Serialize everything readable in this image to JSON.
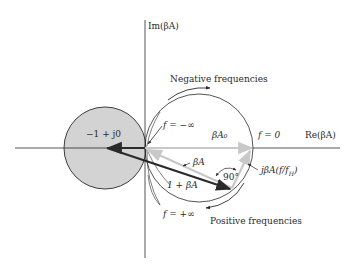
{
  "axes": {
    "imag_label": "Im(βA)",
    "real_label": "Re(βA)"
  },
  "labels": {
    "critical_point": "−1 + j0",
    "negative_frequencies": "Negative frequencies",
    "positive_frequencies": "Positive frequencies",
    "f_minus_inf": "f = −∞",
    "f_plus_inf": "f = +∞",
    "f_zero": "f = 0",
    "beta_a0": "βA₀",
    "beta_a": "βA",
    "one_plus_beta_a": "1 + βA",
    "right_angle": "90°",
    "j_term": "jβA(f/f",
    "j_term_sub": "H",
    "j_term_close": ")"
  },
  "colors": {
    "stroke": "#2a2a2a",
    "shaded_circle_fill": "#d3d3d3",
    "gray_vector": "#c8c8c8",
    "background": "#ffffff"
  },
  "geometry": {
    "origin": [
      145,
      148
    ],
    "critical_point": [
      105,
      148
    ],
    "shaded_circle_radius": 41,
    "locus_circle_center": [
      199,
      148
    ],
    "locus_circle_radius": 54,
    "tip_point": [
      230,
      189
    ],
    "beta_a0_point": [
      253,
      148
    ]
  }
}
